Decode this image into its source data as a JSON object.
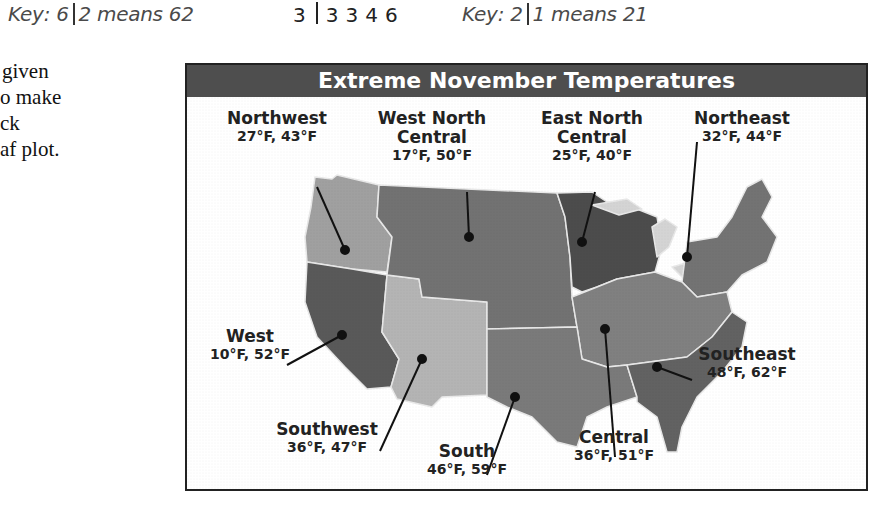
{
  "header": {
    "key_left": {
      "prefix": "Key: 6",
      "suffix": "2 means 62"
    },
    "stem_row": {
      "stem": "3",
      "leaves": [
        "3",
        "3",
        "4",
        "6"
      ]
    },
    "key_right": {
      "prefix": "Key: 2",
      "suffix": "1 means 21"
    }
  },
  "side_text": [
    "given",
    "o make",
    "ck",
    "af plot."
  ],
  "map": {
    "title": "Extreme November Temperatures",
    "colors": {
      "title_bg": "#4e4e4e",
      "border": "#222222",
      "dark": "#4a4a4a",
      "mid": "#6e6e6e",
      "light": "#a8a8a8",
      "lighter": "#c4c4c4",
      "lakes": "#d8d8d8"
    },
    "regions": [
      {
        "id": "northwest",
        "name": "Northwest",
        "low": "27°F",
        "high": "43°F",
        "values": "27°F, 43°F"
      },
      {
        "id": "west-north-central",
        "name": "West North Central",
        "name_line1": "West North",
        "name_line2": "Central",
        "low": "17°F",
        "high": "50°F",
        "values": "17°F, 50°F"
      },
      {
        "id": "east-north-central",
        "name": "East North Central",
        "name_line1": "East North",
        "name_line2": "Central",
        "low": "25°F",
        "high": "40°F",
        "values": "25°F, 40°F"
      },
      {
        "id": "northeast",
        "name": "Northeast",
        "low": "32°F",
        "high": "44°F",
        "values": "32°F, 44°F"
      },
      {
        "id": "west",
        "name": "West",
        "low": "10°F",
        "high": "52°F",
        "values": "10°F, 52°F"
      },
      {
        "id": "southeast",
        "name": "Southeast",
        "low": "48°F",
        "high": "62°F",
        "values": "48°F, 62°F"
      },
      {
        "id": "southwest",
        "name": "Southwest",
        "low": "36°F",
        "high": "47°F",
        "values": "36°F, 47°F"
      },
      {
        "id": "south",
        "name": "South",
        "low": "46°F",
        "high": "59°F",
        "values": "46°F, 59°F"
      },
      {
        "id": "central",
        "name": "Central",
        "low": "36°F",
        "high": "51°F",
        "values": "36°F, 51°F"
      }
    ]
  }
}
